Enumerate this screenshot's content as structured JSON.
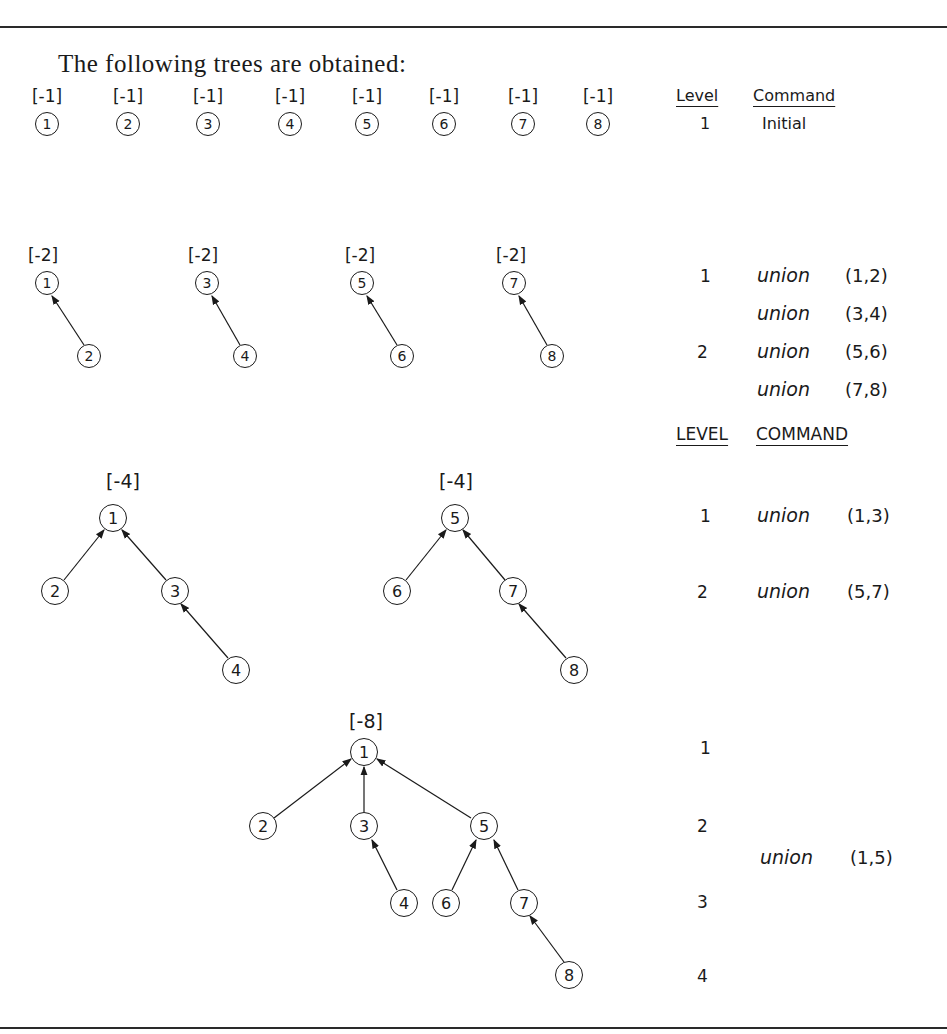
{
  "heading": "The following trees are obtained:",
  "stage1": {
    "weights": [
      "[-1]",
      "[-1]",
      "[-1]",
      "[-1]",
      "[-1]",
      "[-1]",
      "[-1]",
      "[-1]"
    ],
    "nodes": [
      "1",
      "2",
      "3",
      "4",
      "5",
      "6",
      "7",
      "8"
    ],
    "level_header": "Level",
    "command_header": "Command",
    "level": "1",
    "command": "Initial"
  },
  "stage2": {
    "weights": [
      "[-2]",
      "[-2]",
      "[-2]",
      "[-2]"
    ],
    "trees": [
      {
        "root": "1",
        "child": "2"
      },
      {
        "root": "3",
        "child": "4"
      },
      {
        "root": "5",
        "child": "6"
      },
      {
        "root": "7",
        "child": "8"
      }
    ],
    "levels": [
      "1",
      "2"
    ],
    "commands": [
      {
        "op": "union",
        "args": "(1,2)"
      },
      {
        "op": "union",
        "args": "(3,4)"
      },
      {
        "op": "union",
        "args": "(5,6)"
      },
      {
        "op": "union",
        "args": "(7,8)"
      }
    ]
  },
  "stage3": {
    "level_header": "LEVEL",
    "command_header": "COMMAND",
    "weights": [
      "[-4]",
      "[-4]"
    ],
    "nodes": {
      "a1": "1",
      "a2": "2",
      "a3": "3",
      "a4": "4",
      "b5": "5",
      "b6": "6",
      "b7": "7",
      "b8": "8"
    },
    "levels": [
      "1",
      "2"
    ],
    "commands": [
      {
        "op": "union",
        "args": "(1,3)"
      },
      {
        "op": "union",
        "args": "(5,7)"
      }
    ]
  },
  "stage4": {
    "weight": "[-8]",
    "nodes": {
      "n1": "1",
      "n2": "2",
      "n3": "3",
      "n4": "4",
      "n5": "5",
      "n6": "6",
      "n7": "7",
      "n8": "8"
    },
    "levels": [
      "1",
      "2",
      "3",
      "4"
    ],
    "command": {
      "op": "union",
      "args": "(1,5)"
    }
  }
}
